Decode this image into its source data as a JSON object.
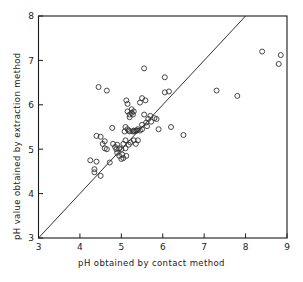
{
  "figure": {
    "background": "#ffffff",
    "foreground": "#1a1a1a",
    "marker_color": "#333333"
  },
  "chart_data": {
    "type": "scatter",
    "title": "",
    "xlabel": "pH obtained by contact method",
    "ylabel": "pH value obtained by extraction method",
    "xlim": [
      3,
      9
    ],
    "ylim": [
      3,
      8
    ],
    "xticks": [
      3,
      4,
      5,
      6,
      7,
      8,
      9
    ],
    "yticks": [
      3,
      4,
      5,
      6,
      7,
      8
    ],
    "xticklabels": [
      "3",
      "4",
      "5",
      "6",
      "7",
      "8",
      "9"
    ],
    "yticklabels": [
      "3",
      "4",
      "5",
      "6",
      "7",
      "8"
    ],
    "grid": false,
    "legend": null,
    "marker": "open-circle",
    "annotations": [
      {
        "name": "identity-line",
        "type": "line",
        "description": "1:1 reference line y = x",
        "x": [
          3.0,
          8.0
        ],
        "y": [
          3.0,
          8.0
        ]
      }
    ],
    "series": [
      {
        "name": "soil samples",
        "points": [
          [
            4.25,
            4.75
          ],
          [
            4.35,
            4.55
          ],
          [
            4.35,
            4.48
          ],
          [
            4.4,
            4.72
          ],
          [
            4.5,
            4.4
          ],
          [
            4.45,
            6.4
          ],
          [
            4.65,
            6.32
          ],
          [
            4.4,
            5.3
          ],
          [
            4.5,
            5.28
          ],
          [
            4.55,
            5.12
          ],
          [
            4.6,
            5.18
          ],
          [
            4.6,
            5.02
          ],
          [
            4.65,
            5.0
          ],
          [
            4.72,
            4.7
          ],
          [
            4.78,
            5.48
          ],
          [
            4.8,
            5.12
          ],
          [
            4.85,
            5.05
          ],
          [
            4.88,
            5.0
          ],
          [
            4.9,
            5.1
          ],
          [
            4.9,
            4.92
          ],
          [
            4.95,
            5.02
          ],
          [
            4.95,
            4.85
          ],
          [
            5.0,
            5.0
          ],
          [
            5.0,
            4.78
          ],
          [
            5.02,
            4.88
          ],
          [
            5.05,
            5.12
          ],
          [
            5.05,
            4.8
          ],
          [
            5.08,
            5.4
          ],
          [
            5.1,
            5.5
          ],
          [
            5.1,
            5.2
          ],
          [
            5.1,
            5.02
          ],
          [
            5.12,
            4.85
          ],
          [
            5.12,
            6.1
          ],
          [
            5.15,
            6.02
          ],
          [
            5.15,
            5.85
          ],
          [
            5.15,
            5.45
          ],
          [
            5.18,
            5.42
          ],
          [
            5.18,
            5.1
          ],
          [
            5.2,
            5.78
          ],
          [
            5.2,
            5.72
          ],
          [
            5.2,
            5.4
          ],
          [
            5.22,
            5.15
          ],
          [
            5.25,
            5.9
          ],
          [
            5.25,
            5.82
          ],
          [
            5.28,
            5.78
          ],
          [
            5.28,
            5.4
          ],
          [
            5.3,
            5.85
          ],
          [
            5.3,
            5.42
          ],
          [
            5.3,
            5.2
          ],
          [
            5.32,
            5.4
          ],
          [
            5.35,
            5.42
          ],
          [
            5.35,
            5.12
          ],
          [
            5.38,
            5.42
          ],
          [
            5.4,
            5.45
          ],
          [
            5.4,
            5.2
          ],
          [
            5.45,
            6.05
          ],
          [
            5.5,
            6.15
          ],
          [
            5.45,
            5.42
          ],
          [
            5.5,
            5.45
          ],
          [
            5.5,
            5.55
          ],
          [
            5.55,
            6.82
          ],
          [
            5.58,
            6.1
          ],
          [
            5.55,
            5.78
          ],
          [
            5.6,
            5.6
          ],
          [
            5.62,
            5.52
          ],
          [
            5.65,
            5.68
          ],
          [
            5.7,
            5.75
          ],
          [
            5.72,
            5.62
          ],
          [
            5.8,
            5.7
          ],
          [
            5.85,
            5.68
          ],
          [
            5.9,
            5.45
          ],
          [
            6.05,
            6.62
          ],
          [
            6.05,
            6.28
          ],
          [
            6.15,
            6.3
          ],
          [
            6.2,
            5.5
          ],
          [
            6.5,
            5.32
          ],
          [
            7.3,
            6.32
          ],
          [
            7.8,
            6.2
          ],
          [
            8.4,
            7.2
          ],
          [
            8.85,
            7.12
          ],
          [
            8.8,
            6.92
          ]
        ]
      }
    ]
  }
}
